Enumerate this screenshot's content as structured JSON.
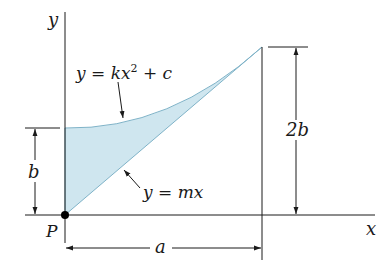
{
  "diagram": {
    "axes": {
      "x_label": "x",
      "y_label": "y"
    },
    "origin_label": "P",
    "curves": {
      "upper": {
        "equation_prefix": "y = kx",
        "exponent": "2",
        "equation_suffix": " + c"
      },
      "lower": {
        "equation": "y = mx"
      }
    },
    "dimensions": {
      "left_height": "b",
      "right_height": "2b",
      "width": "a"
    },
    "colors": {
      "fill": "#cfe6ef",
      "stroke": "#7fb3c8",
      "line": "#1a1a1a"
    }
  }
}
